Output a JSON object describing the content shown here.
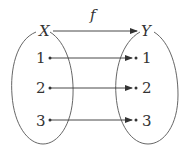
{
  "diagram": {
    "domain_set": {
      "label": "X",
      "elements": [
        "1",
        "2",
        "3"
      ]
    },
    "codomain_set": {
      "label": "Y",
      "elements": [
        "1",
        "2",
        "3"
      ]
    },
    "function": {
      "label": "f"
    },
    "mappings": [
      {
        "from": "1",
        "to": "1"
      },
      {
        "from": "2",
        "to": "2"
      },
      {
        "from": "3",
        "to": "3"
      }
    ]
  }
}
